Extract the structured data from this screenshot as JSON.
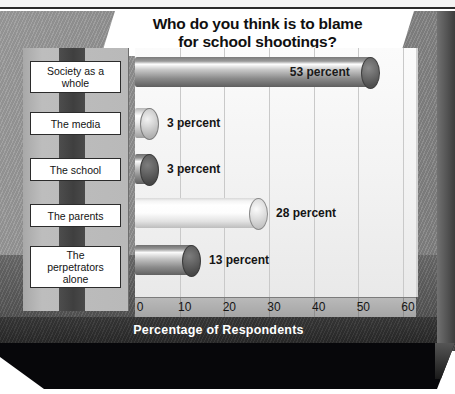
{
  "top_strip": {
    "clipped_text": ""
  },
  "title": {
    "line1": "Who do you think is to blame",
    "line2": "for school shootings?"
  },
  "axis": {
    "x_title": "Percentage of Respondents",
    "ticks": [
      "0",
      "10",
      "20",
      "30",
      "40",
      "50",
      "60"
    ]
  },
  "chart_data": {
    "type": "bar",
    "orientation": "horizontal",
    "title": "Who do you think is to blame for school shootings?",
    "xlabel": "Percentage of Respondents",
    "ylabel": "",
    "xlim": [
      0,
      60
    ],
    "grid": true,
    "legend": "none",
    "categories": [
      "Society as a whole",
      "The media",
      "The school",
      "The parents",
      "The perpetrators alone"
    ],
    "values": [
      53,
      3,
      3,
      28,
      13
    ],
    "value_labels": [
      "53 percent",
      "3 percent",
      "3 percent",
      "28 percent",
      "13 percent"
    ],
    "label_placement": [
      "inside",
      "outside",
      "outside",
      "outside",
      "outside"
    ],
    "bar_style": "3d-cylinder",
    "bar_shades": [
      "dark-gray",
      "light-gray",
      "medium-gray",
      "near-white",
      "medium-gray"
    ]
  },
  "labels": [
    {
      "text": "Society as a\nwhole",
      "line1": "Society as a",
      "line2": "whole"
    },
    {
      "text": "The media",
      "line1": "The media",
      "line2": ""
    },
    {
      "text": "The school",
      "line1": "The school",
      "line2": ""
    },
    {
      "text": "The parents",
      "line1": "The parents",
      "line2": ""
    },
    {
      "text": "The perpetrators alone",
      "line1": "The",
      "line2": "perpetrators",
      "line3": "alone"
    }
  ],
  "colors": {
    "background": "#8e8e8e",
    "plot_background": "#f6f6f6",
    "title_banner": "#ffffff",
    "axis_band": "#b0b0b0",
    "xtitle_band": "#333333",
    "plinth": "#07070a",
    "label_box": "#ffffff",
    "label_stripe": "#454545"
  }
}
